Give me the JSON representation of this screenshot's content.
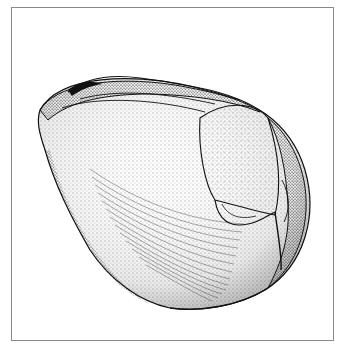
{
  "figure": {
    "caption": "",
    "colors": {
      "ink": "#111111",
      "paper": "#ffffff",
      "frame": "#8a8a8a"
    }
  }
}
